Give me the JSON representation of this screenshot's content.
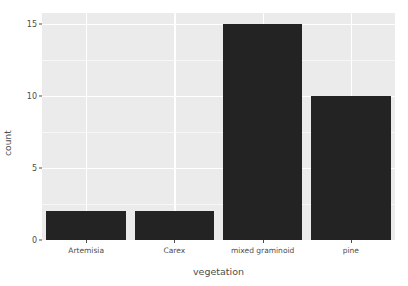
{
  "chart_data": {
    "type": "bar",
    "title": "",
    "subtitle": "",
    "xlabel": "vegetation",
    "ylabel": "count",
    "categories": [
      "Artemisia",
      "Carex",
      "mixed graminoid",
      "pine"
    ],
    "values": [
      2,
      2,
      15,
      10
    ],
    "ylim": [
      0,
      15.75
    ],
    "y_ticks": [
      0,
      5,
      10,
      15
    ],
    "y_tick_labels": [
      "0",
      "5",
      "10",
      "15"
    ],
    "y_minor_ticks": [
      2.5,
      7.5,
      12.5
    ],
    "grid": true,
    "legend": "none",
    "bar_color": "#232323",
    "panel_color": "#ebebeb",
    "gridline_color": "#ffffff",
    "text_color": "#4d4d4d"
  }
}
